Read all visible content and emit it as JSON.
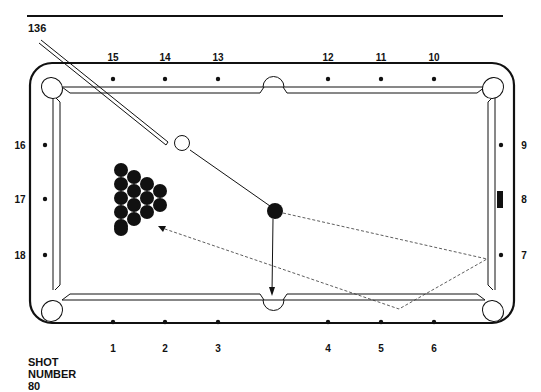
{
  "header": {
    "diagram_number": "136"
  },
  "footer": {
    "shot_label_line1": "SHOT",
    "shot_label_line2": "NUMBER",
    "shot_number": "80"
  },
  "diamonds": {
    "top": [
      "15",
      "14",
      "13",
      "12",
      "11",
      "10"
    ],
    "bottom": [
      "1",
      "2",
      "3",
      "4",
      "5",
      "6"
    ],
    "left": [
      "16",
      "17",
      "18"
    ],
    "right": [
      "9",
      "8",
      "7"
    ]
  },
  "balls": {
    "cue_ball": "white",
    "object_ball": "black",
    "rack_count": 15
  },
  "colors": {
    "ink": "#111111",
    "paper": "#ffffff"
  }
}
